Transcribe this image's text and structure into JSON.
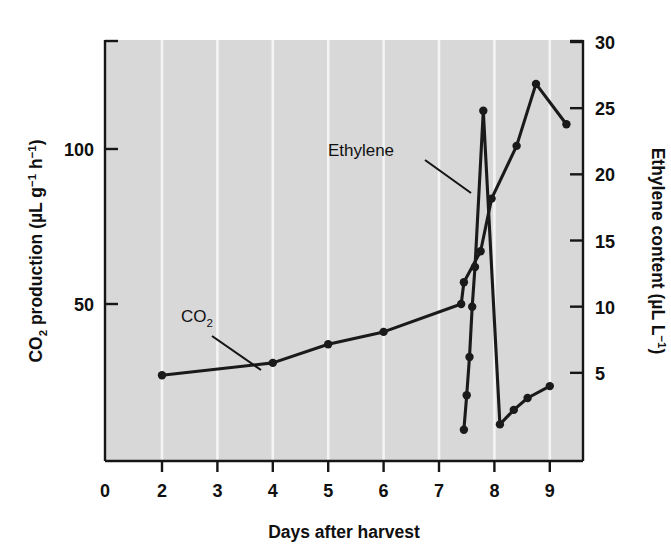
{
  "chart_data": {
    "type": "line",
    "title": "",
    "xlabel": "Days after harvest",
    "ylabel_left": "CO2 production (µL g-1 h-1)",
    "ylabel_right": "Ethylene content (µL L-1)",
    "xlim": [
      0,
      9.6
    ],
    "ylim_left": [
      0,
      130
    ],
    "ylim_right": [
      0,
      31.5
    ],
    "xticks": [
      0,
      2,
      3,
      4,
      5,
      6,
      7,
      8,
      9
    ],
    "xtick_labels": [
      "0",
      "2",
      "3",
      "4",
      "5",
      "6",
      "7",
      "8",
      "9"
    ],
    "yticks_left": [
      50,
      100
    ],
    "ytick_labels_left": [
      "50",
      "100"
    ],
    "yticks_right": [
      5,
      10,
      15,
      20,
      25,
      30
    ],
    "ytick_labels_right": [
      "5",
      "10",
      "15",
      "20",
      "25",
      "30"
    ],
    "grid": "vertical-white-gridlines",
    "legend": "inline-annotations",
    "plot_background": "#d8d8d8",
    "line_color": "#1a1a1a",
    "marker": "filled-circle",
    "series": [
      {
        "name": "CO2",
        "axis": "left",
        "units": "µL g-1 h-1",
        "label_text": "CO2",
        "points": [
          {
            "x": 2.0,
            "y": 27
          },
          {
            "x": 4.0,
            "y": 31
          },
          {
            "x": 5.0,
            "y": 37
          },
          {
            "x": 6.0,
            "y": 41
          },
          {
            "x": 7.4,
            "y": 50
          },
          {
            "x": 7.45,
            "y": 57
          },
          {
            "x": 7.75,
            "y": 67
          },
          {
            "x": 7.95,
            "y": 84
          },
          {
            "x": 8.4,
            "y": 101
          },
          {
            "x": 8.75,
            "y": 121
          },
          {
            "x": 9.3,
            "y": 108
          }
        ]
      },
      {
        "name": "Ethylene",
        "axis": "right",
        "units": "µL L-1",
        "label_text": "Ethylene",
        "points": [
          {
            "x": 7.45,
            "y": 0.7
          },
          {
            "x": 7.5,
            "y": 3.3
          },
          {
            "x": 7.55,
            "y": 6.2
          },
          {
            "x": 7.6,
            "y": 10.0
          },
          {
            "x": 7.65,
            "y": 13.0
          },
          {
            "x": 7.8,
            "y": 24.8
          },
          {
            "x": 8.1,
            "y": 1.1
          },
          {
            "x": 8.35,
            "y": 2.2
          },
          {
            "x": 8.6,
            "y": 3.1
          },
          {
            "x": 9.0,
            "y": 4.0
          }
        ]
      }
    ],
    "annotations": [
      {
        "text": "CO2",
        "kind": "series-callout",
        "target": "CO2"
      },
      {
        "text": "Ethylene",
        "kind": "series-callout",
        "target": "Ethylene"
      }
    ]
  },
  "figure": {
    "xaxis_title": "Days after harvest",
    "left_axis": {
      "main": "CO",
      "sub": "2",
      "rest": " production (µL g",
      "sup1": "−1",
      "mid": " h",
      "sup2": "−1",
      "close": ")"
    },
    "right_axis": {
      "main": "Ethylene content (µL L",
      "sup": "−1",
      "close": ")"
    },
    "callout_co2_main": "CO",
    "callout_co2_sub": "2",
    "callout_ethylene": "Ethylene"
  }
}
